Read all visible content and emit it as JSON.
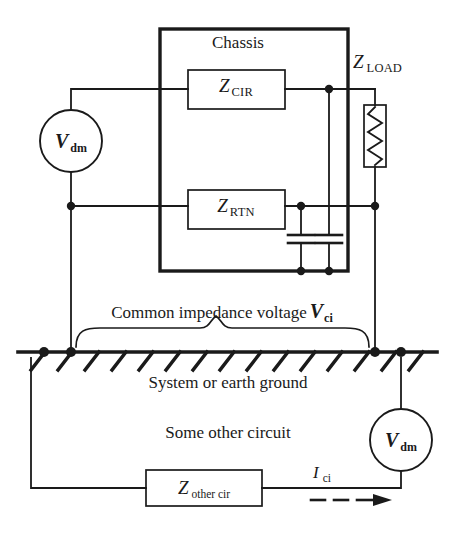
{
  "diagram": {
    "type": "schematic",
    "colors": {
      "line": "#1a1a1a",
      "background": "#ffffff",
      "text": "#1a1a1a"
    },
    "labels": {
      "chassis": "Chassis",
      "z_cir_main": "Z",
      "z_cir_sub": "CIR",
      "z_rtn_main": "Z",
      "z_rtn_sub": "RTN",
      "z_load_main": "Z",
      "z_load_sub": "LOAD",
      "z_other_main": "Z",
      "z_other_sub": "other cir",
      "vdm_top_main": "V",
      "vdm_top_sub": "dm",
      "vdm_bottom_main": "V",
      "vdm_bottom_sub": "dm",
      "common_impedance_text": "Common impedance voltage",
      "vci_main": "V",
      "vci_sub": "ci",
      "ground_text": "System or earth ground",
      "other_circuit_text": "Some other circuit",
      "ici_main": "I",
      "ici_sub": "ci"
    },
    "components": [
      {
        "name": "chassis-enclosure",
        "kind": "enclosure",
        "label": "Chassis"
      },
      {
        "name": "z-cir-box",
        "kind": "impedance-box",
        "label": "Z CIR"
      },
      {
        "name": "z-rtn-box",
        "kind": "impedance-box",
        "label": "Z RTN"
      },
      {
        "name": "z-load-resistor",
        "kind": "resistor",
        "label": "Z LOAD"
      },
      {
        "name": "z-other-cir-box",
        "kind": "impedance-box",
        "label": "Z other cir"
      },
      {
        "name": "vdm-top-source",
        "kind": "voltage-source",
        "label": "V dm"
      },
      {
        "name": "vdm-bottom-source",
        "kind": "voltage-source",
        "label": "V dm"
      },
      {
        "name": "capacitor-left",
        "kind": "capacitor",
        "label": ""
      },
      {
        "name": "capacitor-right",
        "kind": "capacitor",
        "label": ""
      },
      {
        "name": "earth-ground-bar",
        "kind": "ground",
        "label": "System or earth ground"
      },
      {
        "name": "common-impedance-brace",
        "kind": "brace",
        "label": "Common impedance voltage Vci"
      },
      {
        "name": "ici-current-arrow",
        "kind": "dashed-arrow",
        "label": "I ci"
      }
    ]
  }
}
